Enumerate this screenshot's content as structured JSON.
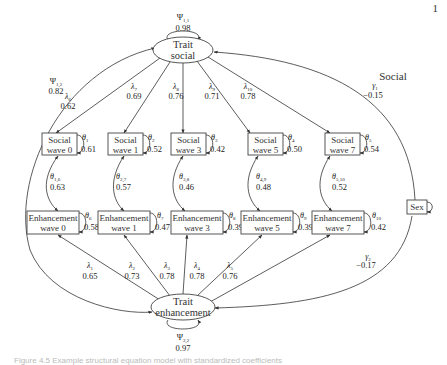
{
  "diagram": {
    "page_number": "1",
    "group_label": "Social",
    "latent": {
      "social": {
        "line1": "Trait",
        "line2": "social",
        "psi_sym": "Ψ",
        "psi_sub": "1,1",
        "psi_val": "0.98"
      },
      "enhancement": {
        "line1": "Trait",
        "line2": "enhancement",
        "psi_sym": "Ψ",
        "psi_sub": "2,2",
        "psi_val": "0.97"
      }
    },
    "covariance": {
      "sym": "Ψ",
      "sub": "1,2",
      "val": "0.82"
    },
    "sex": {
      "label": "Sex",
      "gamma_social": {
        "sym": "γ",
        "sub": "1",
        "val": "−0.15"
      },
      "gamma_enh": {
        "sym": "γ",
        "sub": "2",
        "val": "−0.17"
      }
    },
    "social_waves": [
      {
        "line1": "Social",
        "line2": "wave 0",
        "lambda_sub": "6",
        "lambda_val": "0.62",
        "theta_sub": "1",
        "theta_val": "0.61",
        "theta_cov_sub": "1,6",
        "theta_cov_val": "0.63"
      },
      {
        "line1": "Social",
        "line2": "wave 1",
        "lambda_sub": "7",
        "lambda_val": "0.69",
        "theta_sub": "2",
        "theta_val": "0.52",
        "theta_cov_sub": "2,7",
        "theta_cov_val": "0.57"
      },
      {
        "line1": "Social",
        "line2": "wave 3",
        "lambda_sub": "8",
        "lambda_val": "0.76",
        "theta_sub": "3",
        "theta_val": "0.42",
        "theta_cov_sub": "3,8",
        "theta_cov_val": "0.46"
      },
      {
        "line1": "Social",
        "line2": "wave 5",
        "lambda_sub": "9",
        "lambda_val": "0.71",
        "theta_sub": "4",
        "theta_val": "0.50",
        "theta_cov_sub": "4,9",
        "theta_cov_val": "0.48"
      },
      {
        "line1": "Social",
        "line2": "wave 7",
        "lambda_sub": "10",
        "lambda_val": "0.78",
        "theta_sub": "5",
        "theta_val": "0.54",
        "theta_cov_sub": "5,10",
        "theta_cov_val": "0.52"
      }
    ],
    "enhancement_waves": [
      {
        "line1": "Enhancement",
        "line2": "wave 0",
        "lambda_sub": "1",
        "lambda_val": "0.65",
        "theta_sub": "6",
        "theta_val": "0.58"
      },
      {
        "line1": "Enhancement",
        "line2": "wave 1",
        "lambda_sub": "2",
        "lambda_val": "0.73",
        "theta_sub": "7",
        "theta_val": "0.47"
      },
      {
        "line1": "Enhancement",
        "line2": "wave 3",
        "lambda_sub": "3",
        "lambda_val": "0.78",
        "theta_sub": "8",
        "theta_val": "0.39"
      },
      {
        "line1": "Enhancement",
        "line2": "wave 5",
        "lambda_sub": "4",
        "lambda_val": "0.78",
        "theta_sub": "9",
        "theta_val": "0.39"
      },
      {
        "line1": "Enhancement",
        "line2": "wave 7",
        "lambda_sub": "5",
        "lambda_val": "0.76",
        "theta_sub": "10",
        "theta_val": "0.42"
      }
    ],
    "symbols": {
      "lambda": "λ",
      "theta": "θ"
    },
    "caption": "Figure 4.5  Example structural equation model with standardized coefficients"
  }
}
